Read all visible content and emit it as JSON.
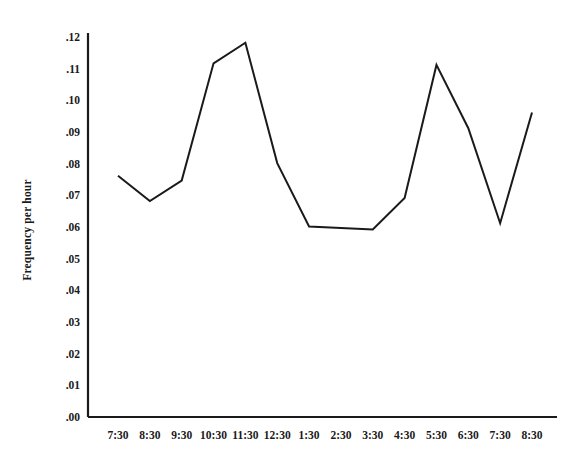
{
  "chart_data": {
    "type": "line",
    "title": "",
    "xlabel": "",
    "ylabel": "Frequency per hour",
    "categories": [
      "7:30",
      "8:30",
      "9:30",
      "10:30",
      "11:30",
      "12:30",
      "1:30",
      "2:30",
      "3:30",
      "4:30",
      "5:30",
      "6:30",
      "7:30",
      "8:30"
    ],
    "values": [
      0.0765,
      0.0685,
      0.075,
      0.112,
      0.1185,
      0.0805,
      0.0605,
      0.06,
      0.0595,
      0.0695,
      0.1115,
      0.0915,
      0.0615,
      0.0965
    ],
    "ylim": [
      0.0,
      0.12
    ],
    "ytick_labels": [
      ".12",
      ".11",
      ".10",
      ".09",
      ".08",
      ".07",
      ".06",
      ".05",
      ".04",
      ".03",
      ".02",
      ".01",
      ".00"
    ],
    "ytick_values": [
      0.12,
      0.11,
      0.1,
      0.09,
      0.08,
      0.07,
      0.06,
      0.05,
      0.04,
      0.03,
      0.02,
      0.01,
      0.0
    ],
    "grid": false,
    "legend": null,
    "series_color": "#1a1a1a",
    "axis_color": "#1a1a1a",
    "background": "#ffffff"
  }
}
